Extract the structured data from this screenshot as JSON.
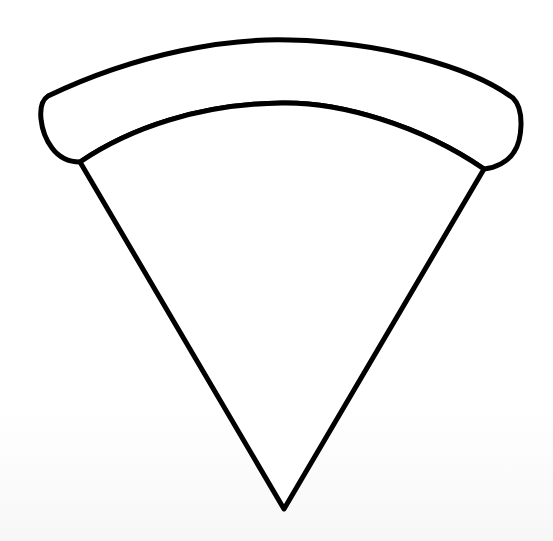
{
  "illustration": {
    "subject": "pizza-slice-outline",
    "stroke_color": "#000000",
    "fill_color": "#ffffff",
    "background_color": "#ffffff"
  }
}
